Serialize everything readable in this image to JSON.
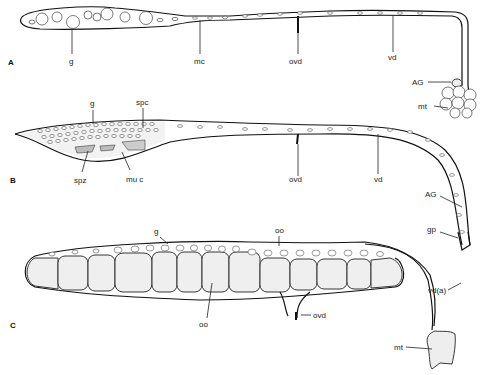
{
  "figure": {
    "panels": [
      {
        "id": "A",
        "label": "A",
        "annotations": [
          {
            "key": "g",
            "text": "g"
          },
          {
            "key": "mc",
            "text": "mc"
          },
          {
            "key": "ovd",
            "text": "ovd"
          },
          {
            "key": "vd",
            "text": "vd"
          },
          {
            "key": "AG",
            "text": "AG"
          },
          {
            "key": "mt",
            "text": "mt"
          }
        ]
      },
      {
        "id": "B",
        "label": "B",
        "annotations": [
          {
            "key": "g",
            "text": "g"
          },
          {
            "key": "spc",
            "text": "spc"
          },
          {
            "key": "spz",
            "text": "spz"
          },
          {
            "key": "muc",
            "text": "mu c"
          },
          {
            "key": "ovd",
            "text": "ovd"
          },
          {
            "key": "vd",
            "text": "vd"
          },
          {
            "key": "AG",
            "text": "AG"
          },
          {
            "key": "gp",
            "text": "gp"
          }
        ]
      },
      {
        "id": "C",
        "label": "C",
        "annotations": [
          {
            "key": "g",
            "text": "g"
          },
          {
            "key": "oo_top",
            "text": "oo"
          },
          {
            "key": "oo_bottom",
            "text": "oo"
          },
          {
            "key": "ovd",
            "text": "ovd"
          },
          {
            "key": "vda",
            "text": "vd(a)"
          },
          {
            "key": "mt",
            "text": "mt"
          }
        ]
      }
    ]
  }
}
